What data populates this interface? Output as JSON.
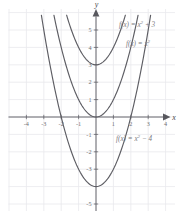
{
  "chart_data": {
    "type": "line",
    "title": "",
    "xlabel": "x",
    "ylabel": "y",
    "xlim": [
      -4.8,
      4.8
    ],
    "ylim": [
      -5.8,
      5.8
    ],
    "grid": true,
    "legend_position": "inline-right",
    "x_ticks": [
      -4,
      -3,
      -2,
      -1,
      1,
      2,
      3,
      4
    ],
    "y_ticks": [
      5,
      4,
      3,
      2,
      1,
      -1,
      -2,
      -3,
      -5
    ],
    "x_tick_labels": [
      "-4",
      "-3",
      "-2",
      "-1",
      "1",
      "2",
      "3",
      "4"
    ],
    "y_tick_labels": [
      "5",
      "4",
      "3",
      "2",
      "1",
      "-1",
      "-2",
      "-3",
      "-5"
    ],
    "series": [
      {
        "name": "f(x) = x^2 + 3",
        "label_main": "f(x) = x",
        "label_exp": "2",
        "label_tail": " + 3",
        "equation": "f(x) = x² + 3",
        "vertex": [
          0,
          3
        ],
        "a": 1,
        "k": 3,
        "x": [
          -1.62,
          -1.2,
          -0.8,
          -0.4,
          0,
          0.4,
          0.8,
          1.2,
          1.62
        ],
        "y": [
          5.62,
          4.44,
          3.64,
          3.16,
          3,
          3.16,
          3.64,
          4.44,
          5.62
        ]
      },
      {
        "name": "f(x) = x^2",
        "label_main": "f(x) = x",
        "label_exp": "2",
        "label_tail": "",
        "equation": "f(x) = x²",
        "vertex": [
          0,
          0
        ],
        "a": 1,
        "k": 0,
        "x": [
          -2.35,
          -1.8,
          -1.2,
          -0.6,
          0,
          0.6,
          1.2,
          1.8,
          2.35
        ],
        "y": [
          5.52,
          3.24,
          1.44,
          0.36,
          0,
          0.36,
          1.44,
          3.24,
          5.52
        ]
      },
      {
        "name": "f(x) = x^2 - 4",
        "label_main": "f(x) = x",
        "label_exp": "2",
        "label_tail": " − 4",
        "equation": "f(x) = x² − 4",
        "vertex": [
          0,
          -4
        ],
        "a": 1,
        "k": -4,
        "x": [
          -2.95,
          -2.2,
          -1.4,
          -0.7,
          0,
          0.7,
          1.4,
          2.2,
          2.95
        ],
        "y": [
          4.7,
          0.84,
          -2.04,
          -3.51,
          -4,
          -3.51,
          -2.04,
          0.84,
          4.7
        ]
      }
    ]
  },
  "axes": {
    "x_name": "x",
    "y_name": "y"
  },
  "colors": {
    "curve": "#5d5d63",
    "grid": "#e9e9ec",
    "axis": "#58585e",
    "label": "#7a7a80",
    "tick": "#6e6e72",
    "background": "#ffffff"
  }
}
